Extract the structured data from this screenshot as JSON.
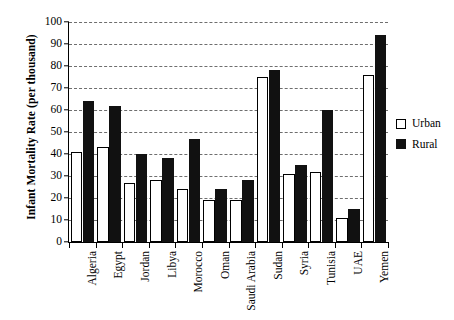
{
  "chart_data": {
    "type": "bar",
    "title": "",
    "xlabel": "",
    "ylabel": "Infant Mortality Rate (per thousand)",
    "ylim": [
      0,
      100
    ],
    "yticks": [
      0,
      10,
      20,
      30,
      40,
      50,
      60,
      70,
      80,
      90,
      100
    ],
    "ytick_labels": [
      "0",
      "10",
      "20",
      "30",
      "40",
      "50",
      "60",
      "70",
      "80",
      "90",
      "100"
    ],
    "grid": true,
    "legend_position": "right",
    "categories": [
      "Algeria",
      "Egypt",
      "Jordan",
      "Libya",
      "Morocco",
      "Oman",
      "Saudi Arabia",
      "Sudan",
      "Syria",
      "Tunisia",
      "UAE",
      "Yemen"
    ],
    "series": [
      {
        "name": "Urban",
        "color": "#ffffff",
        "values": [
          41,
          43,
          27,
          28,
          24,
          19,
          19,
          75,
          31,
          32,
          11,
          76
        ]
      },
      {
        "name": "Rural",
        "color": "#111111",
        "values": [
          64,
          62,
          40,
          38,
          47,
          24,
          28,
          78,
          35,
          60,
          15,
          94
        ]
      }
    ]
  },
  "legend": {
    "items": [
      {
        "label": "Urban",
        "swatch": "open-square-icon"
      },
      {
        "label": "Rural",
        "swatch": "filled-square-icon"
      }
    ]
  }
}
